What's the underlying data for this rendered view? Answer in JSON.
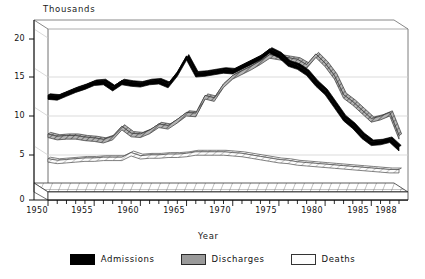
{
  "chart_data": {
    "type": "line",
    "title": "",
    "ylabel": "Thousands",
    "xlabel": "Year",
    "ylim": [
      0,
      20
    ],
    "xlim": [
      1950,
      1988
    ],
    "yticks": [
      "20",
      "15",
      "10",
      "5",
      "0"
    ],
    "ytick_values": [
      20,
      15,
      10,
      5,
      0
    ],
    "xticks": [
      "1950",
      "1955",
      "1960",
      "1965",
      "1970",
      "1975",
      "1980",
      "1985",
      "1988"
    ],
    "xtick_values": [
      1950,
      1955,
      1960,
      1965,
      1970,
      1975,
      1980,
      1985,
      1988
    ],
    "grid": true,
    "legend_position": "bottom",
    "x": [
      1950,
      1951,
      1952,
      1953,
      1954,
      1955,
      1956,
      1957,
      1958,
      1959,
      1960,
      1961,
      1962,
      1963,
      1964,
      1965,
      1966,
      1967,
      1968,
      1969,
      1970,
      1971,
      1972,
      1973,
      1974,
      1975,
      1976,
      1977,
      1978,
      1979,
      1980,
      1981,
      1982,
      1983,
      1984,
      1985,
      1986,
      1987,
      1988
    ],
    "series": [
      {
        "name": "Admissions",
        "color": "#000000",
        "style": "solid-black-ribbon",
        "values": [
          12.3,
          12.2,
          12.7,
          13.2,
          13.6,
          14.1,
          14.2,
          13.4,
          14.2,
          14.0,
          13.9,
          14.2,
          14.3,
          13.8,
          15.3,
          17.4,
          15.2,
          15.3,
          15.5,
          15.7,
          15.6,
          16.2,
          16.8,
          17.4,
          18.3,
          17.7,
          16.6,
          16.2,
          15.4,
          14.0,
          12.9,
          11.2,
          9.5,
          8.5,
          7.2,
          6.3,
          6.4,
          6.7,
          5.6
        ]
      },
      {
        "name": "Discharges",
        "color": "#9a9a9a",
        "style": "hatched-gray-ribbon",
        "values": [
          7.3,
          7.0,
          7.1,
          7.1,
          6.9,
          6.8,
          6.6,
          7.0,
          8.3,
          7.4,
          7.3,
          7.8,
          8.6,
          8.4,
          9.2,
          10.1,
          10.0,
          12.3,
          12.0,
          13.8,
          14.9,
          15.5,
          16.1,
          16.8,
          17.6,
          17.4,
          17.2,
          17.0,
          16.3,
          17.7,
          16.5,
          14.9,
          12.4,
          11.5,
          10.4,
          9.3,
          9.6,
          10.1,
          7.1
        ]
      },
      {
        "name": "Deaths",
        "color": "#fdfdfd",
        "style": "white-outlined-ribbon",
        "values": [
          4.1,
          3.9,
          4.0,
          4.1,
          4.2,
          4.2,
          4.3,
          4.3,
          4.3,
          4.9,
          4.5,
          4.6,
          4.6,
          4.7,
          4.7,
          4.8,
          5.0,
          5.0,
          5.0,
          5.0,
          4.9,
          4.8,
          4.6,
          4.4,
          4.2,
          4.0,
          3.9,
          3.7,
          3.6,
          3.5,
          3.4,
          3.3,
          3.2,
          3.1,
          3.0,
          2.9,
          2.8,
          2.7,
          2.7
        ]
      }
    ]
  },
  "legend": {
    "items": [
      {
        "label": "Admissions",
        "swatch": "sw-admissions"
      },
      {
        "label": "Discharges",
        "swatch": "sw-discharges"
      },
      {
        "label": "Deaths",
        "swatch": "sw-deaths"
      }
    ]
  }
}
